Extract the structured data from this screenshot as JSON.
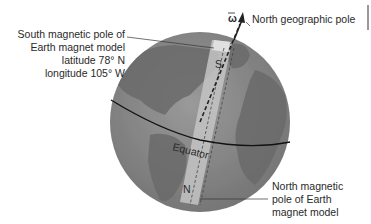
{
  "diagram": {
    "labels": {
      "south_pole": [
        "South magnetic pole of",
        "Earth magnet model",
        "latitude 78° N",
        "longitude 105° W"
      ],
      "north_geo": "North geographic pole",
      "north_mag": [
        "North magnetic",
        "pole of Earth",
        "magnet model"
      ],
      "equator": "Equator",
      "magnet_s": "S",
      "magnet_n": "N",
      "omega": "ω"
    },
    "colors": {
      "ocean": "#8a8a8a",
      "land": "#6e6e6e",
      "magnet": "#bdbdbd",
      "line": "#222222"
    }
  }
}
